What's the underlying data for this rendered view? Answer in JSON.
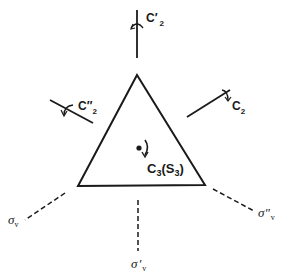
{
  "diagram": {
    "shape": "equilateral-triangle",
    "colors": {
      "stroke": "#1a1a1a",
      "background": "#ffffff"
    },
    "principal_axis": {
      "label_main": "C",
      "label_sub": "3",
      "paren_main": "S",
      "paren_sub": "3",
      "full": "C3(S3)"
    },
    "c2_axes": [
      {
        "label_main": "C",
        "prime": "′",
        "sub": "2",
        "full": "C′2",
        "position": "top"
      },
      {
        "label_main": "C",
        "prime": "″",
        "sub": "2",
        "full": "C″2",
        "position": "upper-left"
      },
      {
        "label_main": "C",
        "prime": "",
        "sub": "2",
        "full": "C2",
        "position": "upper-right"
      }
    ],
    "mirror_planes": [
      {
        "label_main": "σ",
        "prime": "",
        "sub": "v",
        "full": "σv",
        "position": "lower-left"
      },
      {
        "label_main": "σ",
        "prime": "′",
        "sub": "v",
        "full": "σ′v",
        "position": "bottom"
      },
      {
        "label_main": "σ",
        "prime": "″",
        "sub": "v",
        "full": "σ″v",
        "position": "lower-right"
      }
    ]
  }
}
